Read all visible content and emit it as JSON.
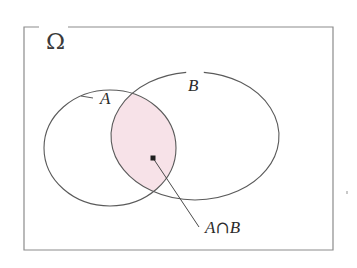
{
  "figure": {
    "type": "venn-diagram",
    "background_color": "#ffffff"
  },
  "universe": {
    "label": "Ω",
    "name": "omega-universal-set",
    "border_color": "#8c8c8c",
    "border_width": 1.2,
    "box": {
      "x": 24,
      "y": 27,
      "width": 309,
      "height": 223
    },
    "label_position": {
      "x": 46,
      "y": 34
    },
    "label_font_size": 23,
    "top_border_gap": {
      "start_x": 39,
      "end_x": 68
    }
  },
  "sets": [
    {
      "name": "set-a",
      "label": "A",
      "cx": 110,
      "cy": 148,
      "rx": 66,
      "ry": 58,
      "stroke": "#5a5a5a",
      "label_position": {
        "x": 100,
        "y": 101
      },
      "label_font_size": 17,
      "leader_line": {
        "x1": 81,
        "y1": 96,
        "x2": 93,
        "y2": 98
      }
    },
    {
      "name": "set-b",
      "label": "B",
      "cx": 195,
      "cy": 136,
      "rx": 84,
      "ry": 64,
      "stroke": "#5a5a5a",
      "label_position": {
        "x": 188,
        "y": 88
      },
      "label_font_size": 17
    }
  ],
  "intersection": {
    "name": "a-intersect-b",
    "label": "A∩B",
    "label_parts": {
      "left": "A",
      "operator": "∩",
      "right": "B"
    },
    "fill_color": "#f7e2e8",
    "stroke": "#5a5a5a",
    "label_position": {
      "x": 205,
      "y": 232
    },
    "label_font_size": 17,
    "marker_point": {
      "x": 153,
      "y": 158
    },
    "leader_line": {
      "x1": 153,
      "y1": 158,
      "x2": 199,
      "y2": 227
    }
  },
  "artifact": {
    "name": "scan-speck",
    "x": 347,
    "y": 192,
    "color": "#c9c9c9"
  }
}
